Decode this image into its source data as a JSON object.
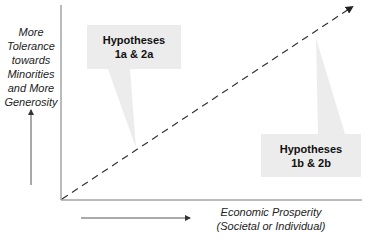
{
  "diagram": {
    "y_axis_label": [
      "More",
      "Tolerance",
      "towards",
      "Minorities",
      "and More",
      "Generosity"
    ],
    "x_axis_label": [
      "Economic Prosperity",
      "(Societal or Individual)"
    ],
    "callouts": [
      {
        "id": "hyp-1a-2a",
        "lines": [
          "Hypotheses",
          "1a & 2a"
        ]
      },
      {
        "id": "hyp-1b-2b",
        "lines": [
          "Hypotheses",
          "1b & 2b"
        ]
      }
    ],
    "colors": {
      "axis": "#666666",
      "trend_line": "#333333",
      "callout_fill": "#ececec",
      "text": "#222222"
    }
  }
}
